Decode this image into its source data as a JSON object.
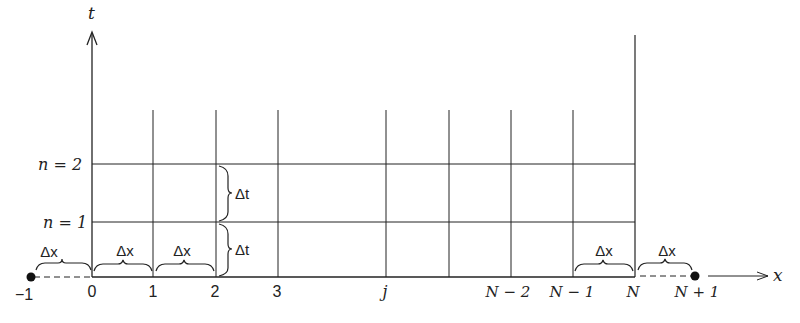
{
  "diagram": {
    "type": "finite-difference grid",
    "axes": {
      "t_label": "t",
      "x_label": "x"
    },
    "time_levels": [
      {
        "label": "n = 2",
        "y": 164
      },
      {
        "label": "n = 1",
        "y": 222
      }
    ],
    "x_nodes": [
      {
        "label": "−1",
        "x": 30,
        "ghost": true
      },
      {
        "label": "0",
        "x": 92
      },
      {
        "label": "1",
        "x": 153
      },
      {
        "label": "2",
        "x": 216
      },
      {
        "label": "3",
        "x": 278
      },
      {
        "label": "j",
        "x": 386
      },
      {
        "label": "",
        "x": 449
      },
      {
        "label": "N − 2",
        "x": 511
      },
      {
        "label": "N − 1",
        "x": 573
      },
      {
        "label": "N",
        "x": 635
      },
      {
        "label": "N + 1",
        "x": 695,
        "ghost": true
      }
    ],
    "spacing_labels": {
      "dx": "Δx",
      "dt": "Δt"
    },
    "colors": {
      "ink": "#222222",
      "background": "#ffffff"
    }
  }
}
